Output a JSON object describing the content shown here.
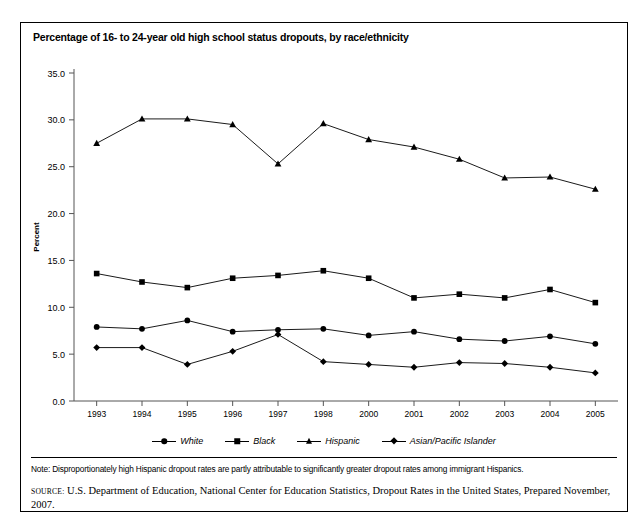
{
  "figure": {
    "title": "Percentage of 16- to 24-year old high school status dropouts, by race/ethnicity",
    "note": "Note: Disproportionately high Hispanic dropout rates are partly attributable to significantly greater dropout rates among immigrant Hispanics.",
    "source_label": "SOURCE:",
    "source_text": "U.S. Department of Education, National Center for Education Statistics, Dropout Rates in the United States, Prepared November, 2007."
  },
  "legend": {
    "position": "bottom-center",
    "items": [
      {
        "label": "White",
        "marker": "circle-marker-icon"
      },
      {
        "label": "Black",
        "marker": "square-marker-icon"
      },
      {
        "label": "Hispanic",
        "marker": "triangle-marker-icon"
      },
      {
        "label": "Asian/Pacific Islander",
        "marker": "diamond-marker-icon"
      }
    ]
  },
  "chart_data": {
    "type": "line",
    "title": "Percentage of 16- to 24-year old high school status dropouts, by race/ethnicity",
    "xlabel": "",
    "ylabel": "Percent",
    "ylim": [
      0,
      35
    ],
    "yticks": [
      "0.0",
      "5.0",
      "10.0",
      "15.0",
      "20.0",
      "25.0",
      "30.0",
      "35.0"
    ],
    "ytick_values": [
      0,
      5,
      10,
      15,
      20,
      25,
      30,
      35
    ],
    "grid": false,
    "categories": [
      "1993",
      "1994",
      "1995",
      "1996",
      "1997",
      "1998",
      "2000",
      "2001",
      "2002",
      "2003",
      "2004",
      "2005"
    ],
    "series": [
      {
        "name": "White",
        "marker": "circle",
        "values": [
          7.9,
          7.7,
          8.6,
          7.4,
          7.6,
          7.7,
          7.0,
          7.4,
          6.6,
          6.4,
          6.9,
          6.1
        ]
      },
      {
        "name": "Black",
        "marker": "square",
        "values": [
          13.6,
          12.7,
          12.1,
          13.1,
          13.4,
          13.9,
          13.1,
          11.0,
          11.4,
          11.0,
          11.9,
          10.5
        ]
      },
      {
        "name": "Hispanic",
        "marker": "triangle",
        "values": [
          27.5,
          30.1,
          30.1,
          29.5,
          25.3,
          29.6,
          27.9,
          27.1,
          25.8,
          23.8,
          23.9,
          22.6
        ]
      },
      {
        "name": "Asian/Pacific Islander",
        "marker": "diamond",
        "values": [
          5.7,
          5.7,
          3.9,
          5.3,
          7.1,
          4.2,
          3.9,
          3.6,
          4.1,
          4.0,
          3.6,
          3.0
        ]
      }
    ]
  }
}
